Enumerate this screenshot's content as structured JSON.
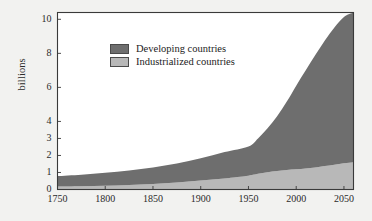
{
  "chart_data": {
    "type": "area",
    "title": "",
    "subtitle": "",
    "xlabel": "",
    "ylabel": "billions",
    "xlim": [
      1750,
      2060
    ],
    "ylim": [
      0,
      10.4
    ],
    "grid": false,
    "stacked": true,
    "legend_position": "upper-left-inside",
    "xticks": [
      1750,
      1800,
      1850,
      1900,
      1950,
      2000,
      2050
    ],
    "xtick_labels": [
      "1750",
      "1800",
      "1850",
      "1900",
      "1950",
      "2000",
      "2050"
    ],
    "yticks": [
      0,
      1,
      2,
      3,
      4,
      6,
      8,
      10
    ],
    "ytick_labels": [
      "0",
      "1",
      "2",
      "3",
      "4",
      "6",
      "8",
      "10"
    ],
    "x": [
      1750,
      1775,
      1800,
      1825,
      1850,
      1875,
      1900,
      1925,
      1950,
      1960,
      1970,
      1980,
      1990,
      2000,
      2010,
      2020,
      2030,
      2040,
      2050,
      2060
    ],
    "series": [
      {
        "name": "Industrialized countries",
        "color": "#b8b8b8",
        "values": [
          0.17,
          0.19,
          0.22,
          0.26,
          0.32,
          0.41,
          0.53,
          0.65,
          0.81,
          0.92,
          1.01,
          1.08,
          1.15,
          1.19,
          1.24,
          1.3,
          1.38,
          1.46,
          1.54,
          1.6
        ]
      },
      {
        "name": "Developing countries",
        "color": "#6e6e6e",
        "values": [
          0.62,
          0.68,
          0.76,
          0.86,
          0.98,
          1.12,
          1.3,
          1.55,
          1.72,
          2.08,
          2.59,
          3.22,
          4.0,
          4.91,
          5.76,
          6.6,
          7.38,
          8.06,
          8.6,
          8.8
        ]
      }
    ],
    "totals": [
      0.79,
      0.87,
      0.98,
      1.12,
      1.3,
      1.53,
      1.83,
      2.2,
      2.53,
      3.0,
      3.6,
      4.3,
      5.15,
      6.1,
      7.0,
      7.9,
      8.76,
      9.52,
      10.14,
      10.4
    ],
    "annotations": []
  },
  "legend": {
    "items": [
      {
        "label": "Developing countries",
        "color": "#6e6e6e"
      },
      {
        "label": "Industrialized countries",
        "color": "#b8b8b8"
      }
    ]
  },
  "style": {
    "background": "#f2f2f0",
    "plot_background": "#ffffff",
    "frame_color": "#3a3a3a",
    "text_color": "#2b2b2b"
  }
}
